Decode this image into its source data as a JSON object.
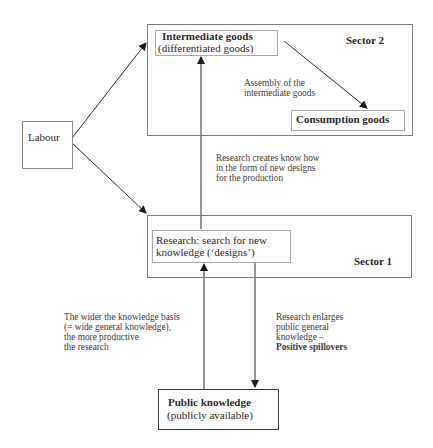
{
  "diagram": {
    "sector2": {
      "label": "Sector 2",
      "intermediate": {
        "title": "Intermediate goods",
        "subtitle": "(differentiated goods)"
      },
      "consumption": {
        "title": "Consumption goods"
      },
      "assembly_note": [
        "Assembly of the",
        "intermediate goods"
      ]
    },
    "sector1": {
      "label": "Sector 1",
      "research": {
        "line1": "Research: search for new",
        "line2": "knowledge (‘designs’)"
      }
    },
    "labour": {
      "label": "Labour"
    },
    "public_knowledge": {
      "title": "Public knowledge",
      "subtitle": "(publicly available)"
    },
    "notes": {
      "research_creates": [
        "Research creates know how",
        "in the form of new designs",
        "for the production"
      ],
      "wider_basis": [
        "The wider the knowledge basis",
        "(= wide general knowledge),",
        "the more productive",
        "the research"
      ],
      "enlarges": [
        "Research enlarges",
        "public general",
        "knowledge –"
      ],
      "spillovers": "Positive spillovers"
    },
    "colors": {
      "line": "#2a2a2a",
      "outer_border": "#7a7a7a",
      "inner_border": "#a8a8a8"
    }
  }
}
